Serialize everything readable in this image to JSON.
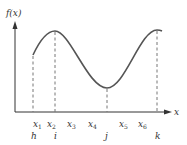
{
  "diagram": {
    "y_axis_label": "f(x)",
    "x_axis_label": "x",
    "x_ticks": [
      {
        "label": "x",
        "sub": "1",
        "x": 34
      },
      {
        "label": "x",
        "sub": "2",
        "x": 50
      },
      {
        "label": "x",
        "sub": "3",
        "x": 70
      },
      {
        "label": "x",
        "sub": "4",
        "x": 91
      },
      {
        "label": "x",
        "sub": "5",
        "x": 122
      },
      {
        "label": "x",
        "sub": "6",
        "x": 141
      }
    ],
    "points": [
      {
        "label": "h",
        "x": 33
      },
      {
        "label": "i",
        "x": 55
      },
      {
        "label": "j",
        "x": 107
      },
      {
        "label": "k",
        "x": 157
      }
    ],
    "colors": {
      "curve": "#555555",
      "axis": "#333333",
      "dashed": "#777777"
    }
  }
}
